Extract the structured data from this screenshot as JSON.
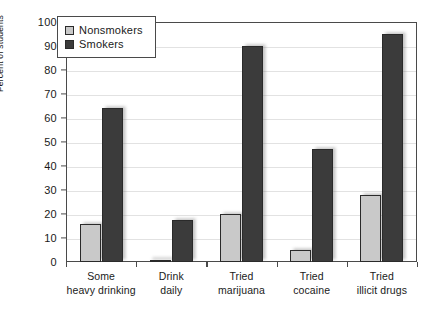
{
  "chart_data": {
    "type": "bar",
    "title": "",
    "xlabel": "",
    "ylabel": "Percent of students",
    "ylim": [
      0,
      100
    ],
    "ytick_step": 10,
    "yticks": [
      0,
      10,
      20,
      30,
      40,
      50,
      60,
      70,
      80,
      90,
      100
    ],
    "grid": true,
    "legend_position": "upper-left-inside",
    "categories": [
      "Some heavy drinking",
      "Drink daily",
      "Tried marijuana",
      "Tried cocaine",
      "Tried illicit drugs"
    ],
    "category_lines": [
      [
        "Some",
        "heavy drinking"
      ],
      [
        "Drink",
        "daily"
      ],
      [
        "Tried",
        "marijuana"
      ],
      [
        "Tried",
        "cocaine"
      ],
      [
        "Tried",
        "illicit drugs"
      ]
    ],
    "series": [
      {
        "name": "Nonsmokers",
        "color": "#c9c9c9",
        "values": [
          16,
          1,
          20,
          5,
          28
        ]
      },
      {
        "name": "Smokers",
        "color": "#3b3b3b",
        "values": [
          64,
          17.5,
          90,
          47,
          95
        ]
      }
    ]
  },
  "legend": {
    "items": [
      {
        "label": "Nonsmokers",
        "swatch": "nonsmokers"
      },
      {
        "label": "Smokers",
        "swatch": "smokers"
      }
    ]
  }
}
